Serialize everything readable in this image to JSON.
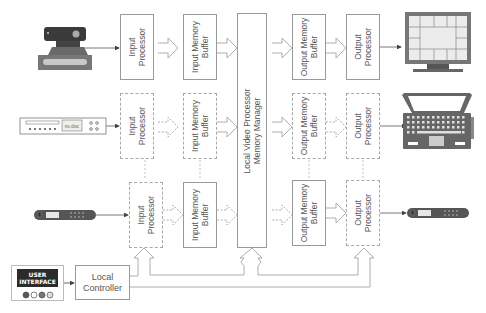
{
  "diagram": {
    "input_rows": [
      {
        "device": "camera-icon",
        "processor": "Input\nProcessor",
        "buffer": "Input Memory\nBuffer"
      },
      {
        "device": "dvd-player-icon",
        "device_label": "no disc",
        "processor": "Input\nProcessor",
        "buffer": "Input Memory\nBuffer"
      },
      {
        "device": "remote-control-icon",
        "processor": "Input\nProcessor",
        "buffer": "Input Memory\nBuffer"
      }
    ],
    "central": {
      "label": "Local Video Processor\nMemory Manager"
    },
    "output_rows": [
      {
        "buffer": "Output Memory\nBuffer",
        "processor": "Output\nProcessor",
        "device": "monitor-icon"
      },
      {
        "buffer": "Output Memory\nBuffer",
        "processor": "Output\nProcessor",
        "device": "laptop-icon"
      },
      {
        "buffer": "Output Memory\nBuffer",
        "processor": "Output\nProcessor",
        "device": "remote-control-icon"
      }
    ],
    "controller": {
      "label": "Local\nController"
    },
    "user_interface": {
      "line1": "USER",
      "line2": "INTERFACE"
    },
    "colors": {
      "line": "#9a9a9a",
      "device_dark": "#555555",
      "device_mid": "#7a7a7a",
      "device_light": "#c8c8c8"
    }
  }
}
